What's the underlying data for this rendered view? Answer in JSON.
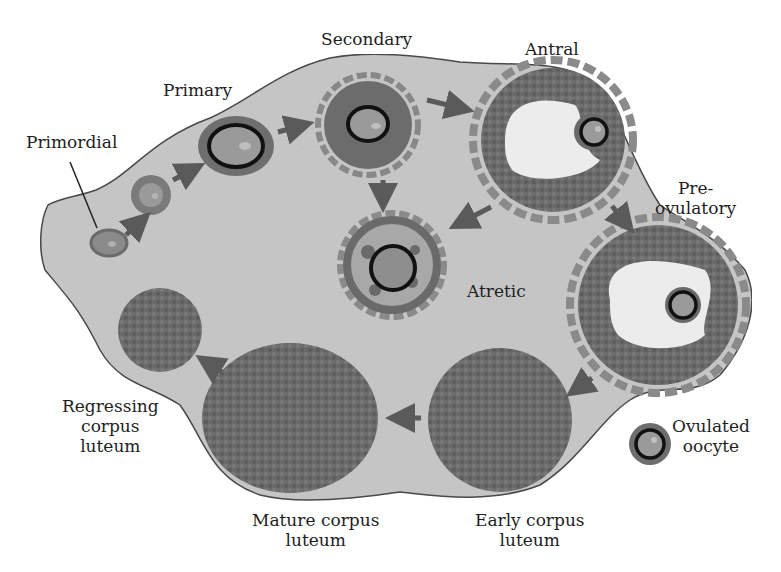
{
  "figure": {
    "colors": {
      "ovary_fill": "#c9c9c9",
      "ovary_outline": "#4a4a4a",
      "granulosa": "#6e6e6e",
      "theca_light": "#bdbdbd",
      "oocyte": "#9a9a9a",
      "zona": "#111111",
      "antrum": "#ececec",
      "corpus_luteum": "#666666",
      "arrow": "#5a5a5a",
      "text": "#1e1e1e"
    },
    "labels": {
      "primordial": [
        "Primordial"
      ],
      "primary": [
        "Primary"
      ],
      "secondary": [
        "Secondary"
      ],
      "antral": [
        "Antral"
      ],
      "preovulatory": [
        "Pre-",
        "ovulatory"
      ],
      "atretic": [
        "Atretic"
      ],
      "ovulated_oocyte": [
        "Ovulated",
        "oocyte"
      ],
      "early_corpus_luteum": [
        "Early corpus",
        "luteum"
      ],
      "mature_corpus_luteum": [
        "Mature corpus",
        "luteum"
      ],
      "regressing_corpus_luteum": [
        "Regressing",
        "corpus",
        "luteum"
      ]
    },
    "flow": [
      "Primordial → Primary",
      "Primary → Secondary",
      "Secondary → Antral",
      "Secondary → Atretic",
      "Antral → Atretic",
      "Antral → Pre-ovulatory",
      "Pre-ovulatory → Early corpus luteum",
      "Early corpus luteum → Mature corpus luteum",
      "Mature corpus luteum → Regressing corpus luteum"
    ]
  }
}
